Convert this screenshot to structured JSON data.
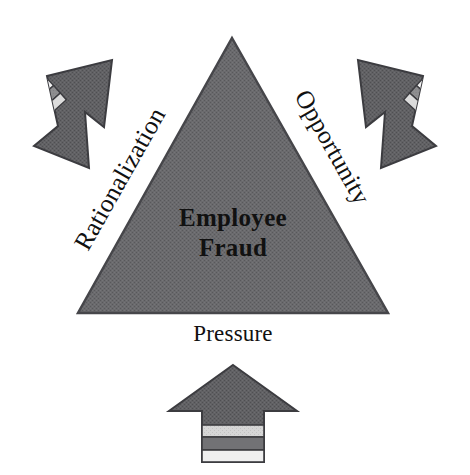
{
  "diagram": {
    "name": "fraud-triangle",
    "background_color": "#ffffff",
    "center": {
      "line1": "Employee",
      "line2": "Fraud",
      "text_color": "#111111"
    },
    "shape": {
      "type": "triangle",
      "fill_color": "#67676a",
      "stroke_color": "#4a4a4d",
      "apex": {
        "x": 232,
        "y": 38
      },
      "bottom_left": {
        "x": 78,
        "y": 313
      },
      "bottom_right": {
        "x": 388,
        "y": 313
      }
    },
    "sides": [
      {
        "id": "left",
        "label": "Rationalization",
        "rotation_deg": -60.5,
        "anchor": {
          "x": 88,
          "y": 252
        }
      },
      {
        "id": "right",
        "label": "Opportunity",
        "rotation_deg": 60.5,
        "anchor": {
          "x": 294,
          "y": 96
        }
      },
      {
        "id": "base",
        "label": "Pressure",
        "rotation_deg": 0,
        "anchor": {
          "x": 233,
          "y": 338
        }
      }
    ],
    "arrows": [
      {
        "id": "arrow-top-left",
        "points_toward": "Rationalization",
        "direction": "down-right",
        "fill_color": "#5f5f62",
        "stroke_color": "#3f3f42",
        "stripes": [
          "#f2f2f2",
          "#8e8e90",
          "#d9d9d9"
        ]
      },
      {
        "id": "arrow-top-right",
        "points_toward": "Opportunity",
        "direction": "down-left",
        "fill_color": "#5f5f62",
        "stroke_color": "#3f3f42",
        "stripes": [
          "#f2f2f2",
          "#8e8e90",
          "#d9d9d9"
        ]
      },
      {
        "id": "arrow-bottom",
        "points_toward": "Pressure",
        "direction": "up",
        "fill_color": "#5f5f62",
        "stroke_color": "#3f3f42",
        "stripes": [
          "#cfcfcf",
          "#6f6f72",
          "#ededed"
        ]
      }
    ]
  }
}
